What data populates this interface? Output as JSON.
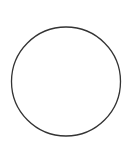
{
  "canvas": {
    "width": 127,
    "height": 150,
    "background": "#ffffff"
  },
  "shapes": [
    {
      "type": "circle",
      "cx": 66,
      "cy": 81.5,
      "r": 54.5,
      "fill": "#ffffff",
      "stroke": "#333333",
      "stroke_width": 1.3
    }
  ]
}
